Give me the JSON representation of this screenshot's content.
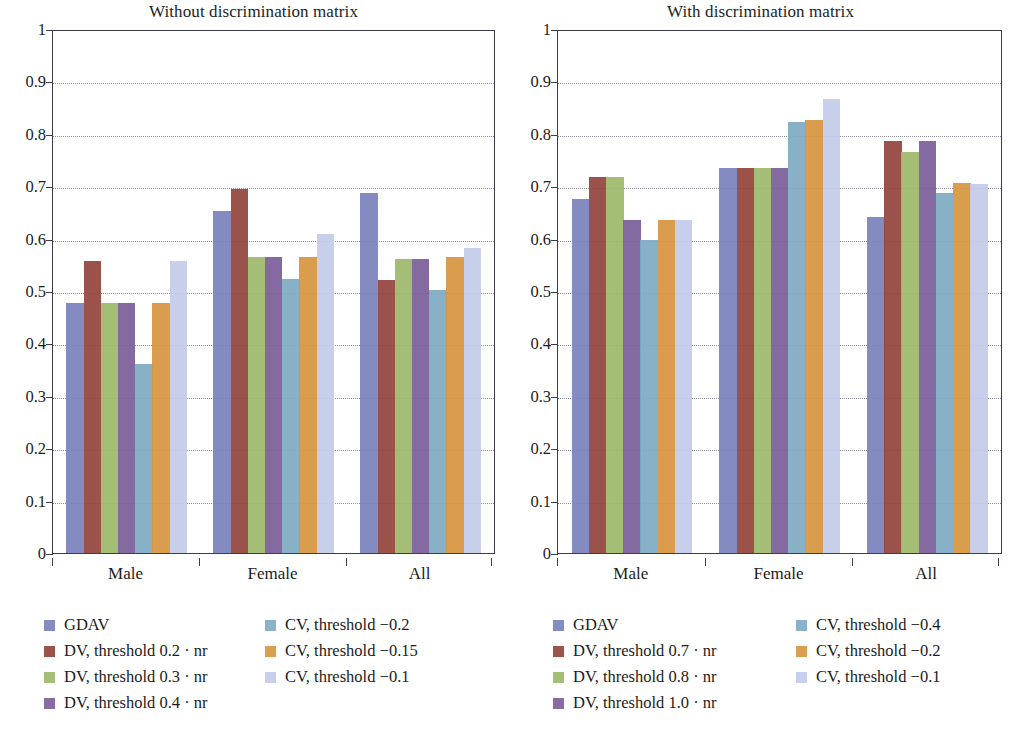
{
  "chart_data": [
    {
      "type": "bar",
      "title": "Without discrimination matrix",
      "xlabel": "",
      "ylabel": "",
      "ylim": [
        0,
        1
      ],
      "ytick_labels": [
        "0",
        "0.1",
        "0.2",
        "0.3",
        "0.4",
        "0.5",
        "0.6",
        "0.7",
        "0.8",
        "0.9",
        "1"
      ],
      "ytick_values": [
        0,
        0.1,
        0.2,
        0.3,
        0.4,
        0.5,
        0.6,
        0.7,
        0.8,
        0.9,
        1
      ],
      "grid": true,
      "legend_position": "below",
      "categories": [
        "Male",
        "Female",
        "All"
      ],
      "series": [
        {
          "name": "GDAV",
          "color": "#7b82bb",
          "values": [
            0.478,
            0.652,
            0.688
          ]
        },
        {
          "name": "DV, threshold 0.2 · nr",
          "color": "#93453c",
          "values": [
            0.558,
            0.695,
            0.521
          ]
        },
        {
          "name": "DV, threshold 0.3 · nr",
          "color": "#9dba6b",
          "values": [
            0.478,
            0.565,
            0.562
          ]
        },
        {
          "name": "DV, threshold 0.4 · nr",
          "color": "#7c5f9b",
          "values": [
            0.478,
            0.565,
            0.562
          ]
        },
        {
          "name": "CV, threshold −0.2",
          "color": "#7fabc4",
          "values": [
            0.36,
            0.523,
            0.502
          ]
        },
        {
          "name": "CV, threshold −0.15",
          "color": "#d79641",
          "values": [
            0.478,
            0.565,
            0.565
          ]
        },
        {
          "name": "CV, threshold −0.1",
          "color": "#c3cbea",
          "values": [
            0.558,
            0.608,
            0.582
          ]
        }
      ]
    },
    {
      "type": "bar",
      "title": "With discrimination matrix",
      "xlabel": "",
      "ylabel": "",
      "ylim": [
        0,
        1
      ],
      "ytick_labels": [
        "0",
        "0.1",
        "0.2",
        "0.3",
        "0.4",
        "0.5",
        "0.6",
        "0.7",
        "0.8",
        "0.9",
        "1"
      ],
      "ytick_values": [
        0,
        0.1,
        0.2,
        0.3,
        0.4,
        0.5,
        0.6,
        0.7,
        0.8,
        0.9,
        1
      ],
      "grid": true,
      "legend_position": "below",
      "categories": [
        "Male",
        "Female",
        "All"
      ],
      "series": [
        {
          "name": "GDAV",
          "color": "#7b82bb",
          "values": [
            0.676,
            0.734,
            0.641
          ]
        },
        {
          "name": "DV, threshold 0.7 · nr",
          "color": "#93453c",
          "values": [
            0.718,
            0.734,
            0.787
          ]
        },
        {
          "name": "DV, threshold 0.8 · nr",
          "color": "#9dba6b",
          "values": [
            0.717,
            0.734,
            0.766
          ]
        },
        {
          "name": "DV, threshold 1.0 · nr",
          "color": "#7c5f9b",
          "values": [
            0.635,
            0.734,
            0.787
          ]
        },
        {
          "name": "CV, threshold −0.4",
          "color": "#7fabc4",
          "values": [
            0.597,
            0.823,
            0.688
          ]
        },
        {
          "name": "CV, threshold −0.2",
          "color": "#d79641",
          "values": [
            0.635,
            0.826,
            0.707
          ]
        },
        {
          "name": "CV, threshold −0.1",
          "color": "#c3cbea",
          "values": [
            0.635,
            0.866,
            0.705
          ]
        }
      ]
    }
  ],
  "panels": [
    {
      "title": "Without discrimination matrix",
      "legend_col_1": [
        "GDAV",
        "DV, threshold 0.2 · nr",
        "DV, threshold 0.3 · nr",
        "DV, threshold 0.4 · nr"
      ],
      "legend_col_2": [
        "CV, threshold −0.2",
        "CV, threshold −0.15",
        "CV, threshold −0.1"
      ]
    },
    {
      "title": "With discrimination matrix",
      "legend_col_1": [
        "GDAV",
        "DV, threshold 0.7 · nr",
        "DV, threshold 0.8 · nr",
        "DV, threshold 1.0 · nr"
      ],
      "legend_col_2": [
        "CV, threshold −0.4",
        "CV, threshold −0.2",
        "CV, threshold −0.1"
      ]
    }
  ],
  "colors": {
    "gdav": "#7b82bb",
    "dv_a": "#93453c",
    "dv_b": "#9dba6b",
    "dv_c": "#7c5f9b",
    "cv_a": "#7fabc4",
    "cv_b": "#d79641",
    "cv_c": "#c3cbea",
    "axis": "#3c3c50",
    "grid": "#8e8e9e",
    "text": "#1c1c1c"
  }
}
